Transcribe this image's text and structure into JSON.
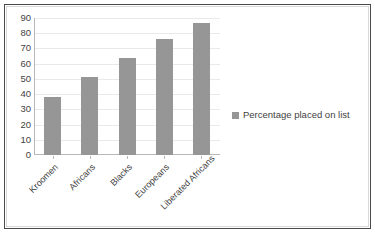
{
  "chart_data": {
    "type": "bar",
    "title": "",
    "subtitle": "",
    "xlabel": "",
    "ylabel": "",
    "categories": [
      "Kroomen",
      "Africans",
      "Blacks",
      "Europeans",
      "Liberated Africans"
    ],
    "series": [
      {
        "name": "Percentage placed on list",
        "values": [
          38,
          51,
          64,
          76,
          87
        ],
        "color": "#969696"
      }
    ],
    "ylim": [
      0,
      90
    ],
    "ytick_step": 10,
    "yticks": [
      0,
      10,
      20,
      30,
      40,
      50,
      60,
      70,
      80,
      90
    ],
    "ytick_labels": [
      "0",
      "10",
      "20",
      "30",
      "40",
      "50",
      "60",
      "70",
      "80",
      "90"
    ],
    "grid": true,
    "grid_axis": "y",
    "legend": {
      "position": "right",
      "entries": [
        "Percentage placed on list"
      ]
    },
    "xtick_rotation": -45
  },
  "figure": {
    "border_color": "#4a4a4a",
    "background": "#ffffff",
    "axis_color": "#b8b8b8",
    "gridline_color": "#e9e9e9",
    "text_color": "#3f3f3f"
  }
}
